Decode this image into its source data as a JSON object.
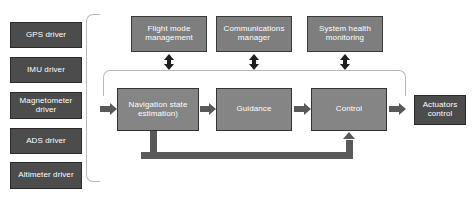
{
  "diagram": {
    "colors": {
      "driver_box": "#4c4c4c",
      "service_box": "#7e7e7e",
      "main_box": "#858585",
      "connector": "#595959",
      "bidirectional_arrow": "#1f1f1f",
      "bracket": "#b9b9b9",
      "background": "#ffffff",
      "box_text": "#ffffff"
    },
    "drivers": {
      "group_label": "",
      "items": [
        {
          "label": "GPS driver"
        },
        {
          "label": "IMU driver"
        },
        {
          "label": "Magnetometer driver"
        },
        {
          "label": "ADS driver"
        },
        {
          "label": "Altimeter driver"
        }
      ]
    },
    "services": [
      {
        "label": "Flight mode management"
      },
      {
        "label": "Communications manager"
      },
      {
        "label": "System health monitoring"
      }
    ],
    "pipeline": [
      {
        "label": "Navigation state estimation)"
      },
      {
        "label": "Guidance"
      },
      {
        "label": "Control"
      }
    ],
    "output": {
      "label": "Actuators control"
    }
  }
}
